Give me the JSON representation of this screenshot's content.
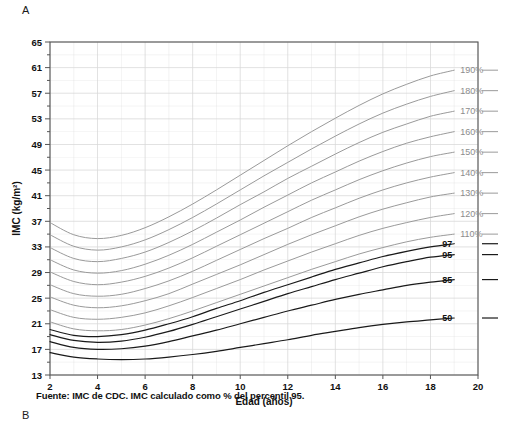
{
  "panels": {
    "top_letter": "A",
    "bottom_letter": "B"
  },
  "caption": "Fuente: IMC de CDC. IMC calculado como % del percentil 95.",
  "chart_data": {
    "type": "line",
    "title": "",
    "xlabel": "Edad (años)",
    "ylabel": "IMC (kg/m²)",
    "xlim": [
      2,
      20
    ],
    "ylim": [
      13,
      65
    ],
    "xticks": [
      2,
      4,
      6,
      8,
      10,
      12,
      14,
      16,
      18,
      20
    ],
    "yticks": [
      13,
      17,
      21,
      25,
      29,
      33,
      37,
      41,
      45,
      49,
      53,
      57,
      61,
      65
    ],
    "grid": true,
    "legend_position": "right-inline-labels",
    "colors": {
      "percent_curve": "#9a9a9a",
      "percentile_curve": "#1a1a1a",
      "grid": "#d8d8d8",
      "axis": "#555555",
      "pct_label": "#8c8c8c"
    },
    "x": [
      2,
      3,
      4,
      5,
      6,
      7,
      8,
      9,
      10,
      11,
      12,
      13,
      14,
      15,
      16,
      17,
      18,
      19
    ],
    "series": [
      {
        "name": "190%",
        "label": "190%",
        "kind": "percent",
        "values": [
          36.8,
          34.9,
          34.3,
          34.8,
          36.0,
          37.7,
          39.7,
          41.9,
          44.2,
          46.5,
          48.8,
          51.0,
          53.1,
          55.1,
          56.9,
          58.4,
          59.7,
          60.6
        ]
      },
      {
        "name": "180%",
        "label": "180%",
        "kind": "percent",
        "values": [
          34.9,
          33.1,
          32.5,
          33.0,
          34.1,
          35.7,
          37.6,
          39.7,
          41.9,
          44.1,
          46.2,
          48.3,
          50.3,
          52.2,
          53.9,
          55.3,
          56.5,
          57.4
        ]
      },
      {
        "name": "170%",
        "label": "170%",
        "kind": "percent",
        "values": [
          32.9,
          31.2,
          30.7,
          31.2,
          32.2,
          33.7,
          35.5,
          37.5,
          39.6,
          41.6,
          43.7,
          45.6,
          47.5,
          49.3,
          50.9,
          52.2,
          53.4,
          54.2
        ]
      },
      {
        "name": "160%",
        "label": "160%",
        "kind": "percent",
        "values": [
          31.0,
          29.4,
          28.9,
          29.3,
          30.3,
          31.7,
          33.4,
          35.3,
          37.2,
          39.2,
          41.1,
          43.0,
          44.7,
          46.4,
          47.9,
          49.2,
          50.2,
          51.0
        ]
      },
      {
        "name": "150%",
        "label": "150%",
        "kind": "percent",
        "values": [
          29.1,
          27.6,
          27.1,
          27.5,
          28.4,
          29.7,
          31.3,
          33.1,
          34.9,
          36.7,
          38.5,
          40.3,
          41.9,
          43.5,
          44.9,
          46.1,
          47.1,
          47.8
        ]
      },
      {
        "name": "140%",
        "label": "140%",
        "kind": "percent",
        "values": [
          27.1,
          25.7,
          25.3,
          25.6,
          26.5,
          27.7,
          29.2,
          30.9,
          32.6,
          34.3,
          35.9,
          37.6,
          39.1,
          40.6,
          41.9,
          43.0,
          43.9,
          44.6
        ]
      },
      {
        "name": "130%",
        "label": "130%",
        "kind": "percent",
        "values": [
          25.2,
          23.9,
          23.5,
          23.8,
          24.6,
          25.7,
          27.2,
          28.7,
          30.2,
          31.8,
          33.4,
          34.9,
          36.3,
          37.7,
          38.9,
          39.9,
          40.8,
          41.4
        ]
      },
      {
        "name": "120%",
        "label": "120%",
        "kind": "percent",
        "values": [
          23.2,
          22.0,
          21.7,
          22.0,
          22.7,
          23.8,
          25.1,
          26.5,
          27.9,
          29.4,
          30.8,
          32.2,
          33.5,
          34.8,
          35.9,
          36.8,
          37.6,
          38.2
        ]
      },
      {
        "name": "110%",
        "label": "110%",
        "kind": "percent",
        "values": [
          21.3,
          20.2,
          19.9,
          20.1,
          20.8,
          21.8,
          23.0,
          24.3,
          25.6,
          26.9,
          28.2,
          29.5,
          30.7,
          31.9,
          32.9,
          33.8,
          34.5,
          35.0
        ]
      },
      {
        "name": "97",
        "label": "97",
        "kind": "percentile",
        "values": [
          20.1,
          19.2,
          19.0,
          19.3,
          20.0,
          21.0,
          22.1,
          23.4,
          24.6,
          25.9,
          27.1,
          28.3,
          29.5,
          30.5,
          31.5,
          32.3,
          33.0,
          33.5
        ]
      },
      {
        "name": "95",
        "label": "95",
        "kind": "percentile",
        "values": [
          19.3,
          18.4,
          18.1,
          18.3,
          18.9,
          19.8,
          20.9,
          22.1,
          23.3,
          24.5,
          25.7,
          26.8,
          27.9,
          28.9,
          29.9,
          30.7,
          31.4,
          31.8
        ]
      },
      {
        "name": "85",
        "label": "85",
        "kind": "percentile",
        "values": [
          18.2,
          17.3,
          17.0,
          17.1,
          17.5,
          18.2,
          19.1,
          20.0,
          21.0,
          22.0,
          23.0,
          23.9,
          24.8,
          25.6,
          26.3,
          27.0,
          27.5,
          27.9
        ]
      },
      {
        "name": "50",
        "label": "50",
        "kind": "percentile",
        "values": [
          16.5,
          15.8,
          15.5,
          15.4,
          15.5,
          15.8,
          16.2,
          16.7,
          17.3,
          17.9,
          18.5,
          19.2,
          19.8,
          20.4,
          20.9,
          21.3,
          21.6,
          21.9
        ]
      }
    ]
  }
}
